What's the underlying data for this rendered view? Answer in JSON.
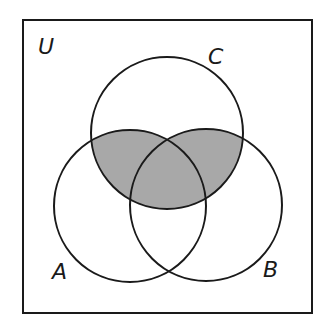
{
  "diagram": {
    "type": "venn",
    "universe_label": "U",
    "sets": [
      {
        "id": "A",
        "label": "A",
        "cx": 130,
        "cy": 206,
        "r": 76
      },
      {
        "id": "B",
        "label": "B",
        "cx": 206,
        "cy": 205,
        "r": 76
      },
      {
        "id": "C",
        "label": "C",
        "cx": 167,
        "cy": 133,
        "r": 76
      }
    ],
    "shaded_region": "C ∩ (A ∪ B)",
    "colors": {
      "stroke": "#1a1a1a",
      "shade": "#a8a8a8",
      "background": "#ffffff"
    }
  }
}
